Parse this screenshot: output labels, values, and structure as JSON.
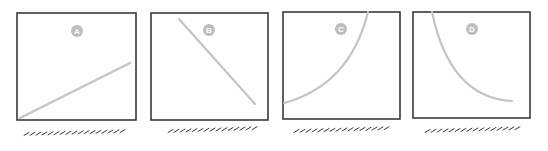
{
  "colors": {
    "frame": "#3a3a3a",
    "curve": "#c4c4c4",
    "badge": "#bdbdbd",
    "badge_text": "#ffffff",
    "caption": "#3a3a3a"
  },
  "panels": [
    {
      "label": "A",
      "description": "linear increasing",
      "box": {
        "x": 17,
        "y": 13,
        "w": 119,
        "h": 107
      },
      "badge": {
        "cx": 77,
        "cy": 31
      },
      "path": "M 20 118 L 130 63"
    },
    {
      "label": "B",
      "description": "linear decreasing",
      "box": {
        "x": 151,
        "y": 13,
        "w": 117,
        "h": 107
      },
      "badge": {
        "cx": 209,
        "cy": 30
      },
      "path": "M 179 19 L 255 104"
    },
    {
      "label": "C",
      "description": "convex increasing (exponential growth)",
      "box": {
        "x": 283,
        "y": 12,
        "w": 117,
        "h": 107
      },
      "badge": {
        "cx": 341,
        "cy": 29
      },
      "path": "M 284 103 Q 350 85 368 12"
    },
    {
      "label": "D",
      "description": "convex decreasing (exponential decay)",
      "box": {
        "x": 413,
        "y": 12,
        "w": 117,
        "h": 106
      },
      "badge": {
        "cx": 472,
        "cy": 29
      },
      "path": "M 432 12 Q 450 98 512 101"
    }
  ],
  "captions": [
    {
      "x1": 24,
      "x2": 130,
      "y": 134
    },
    {
      "x1": 168,
      "x2": 262,
      "y": 131
    },
    {
      "x1": 294,
      "x2": 392,
      "y": 131
    },
    {
      "x1": 425,
      "x2": 523,
      "y": 131
    }
  ]
}
